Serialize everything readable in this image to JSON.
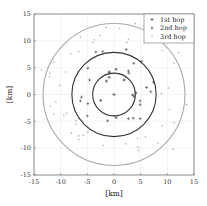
{
  "chart_data": {
    "type": "scatter",
    "title": "",
    "xlabel": "[km]",
    "ylabel": "[km]",
    "xlim": [
      -15,
      15
    ],
    "ylim": [
      -15,
      15
    ],
    "xticks": [
      -15,
      -10,
      -5,
      0,
      5,
      10,
      15
    ],
    "yticks": [
      15,
      10,
      5,
      0,
      -5,
      -10,
      -15
    ],
    "xtick_labels": [
      "-15",
      "-10",
      "-5",
      "0",
      "5",
      "10",
      "15"
    ],
    "ytick_labels": [
      "15",
      "10",
      "5",
      "0",
      "-5",
      "-10",
      "-15"
    ],
    "grid": true,
    "legend_position": "upper right",
    "circles": [
      {
        "name": "1st hop range",
        "radius": 4,
        "color": "#333333"
      },
      {
        "name": "2nd hop range",
        "radius": 7.9,
        "color": "#333333"
      },
      {
        "name": "3rd hop range",
        "radius": 13.3,
        "color": "#aaaaaa"
      }
    ],
    "series": [
      {
        "name": "1st hop",
        "marker": "*",
        "color": "#444444",
        "points": [
          [
            0,
            0
          ],
          [
            0.4,
            4.7
          ],
          [
            -0.9,
            4.2
          ],
          [
            1.9,
            2.7
          ],
          [
            -0.9,
            3.2
          ],
          [
            4.1,
            0.3
          ],
          [
            3.8,
            -0.4
          ],
          [
            0.4,
            -4.3
          ],
          [
            -2.5,
            -1.1
          ],
          [
            3.5,
            -0.1
          ],
          [
            -1.4,
            2.5
          ]
        ]
      },
      {
        "name": "2nd hop",
        "marker": "+",
        "color": "#444444",
        "points": [
          [
            -4.6,
            2.7
          ],
          [
            6.1,
            1.3
          ],
          [
            6.9,
            0.5
          ],
          [
            -6.1,
            -0.5
          ],
          [
            -6.3,
            -1.2
          ],
          [
            -4.9,
            -1.7
          ],
          [
            -5.0,
            -4.0
          ],
          [
            4.9,
            -1.2
          ],
          [
            4.9,
            -1.9
          ],
          [
            4.9,
            -4.5
          ],
          [
            3.6,
            -4.4
          ],
          [
            2.7,
            -4.5
          ],
          [
            -1.2,
            -4.9
          ],
          [
            7.4,
            2.3
          ],
          [
            3.7,
            5.8
          ],
          [
            2.7,
            4.4
          ],
          [
            2.8,
            4.0
          ],
          [
            -2.1,
            8.0
          ],
          [
            -3.4,
            7.9
          ],
          [
            -4.9,
            4.9
          ],
          [
            2.3,
            8.4
          ],
          [
            5.2,
            6.2
          ],
          [
            -0.8,
            4.0
          ]
        ]
      },
      {
        "name": "3rd hop",
        "marker": ".",
        "color": "#b0b0b0",
        "points": [
          [
            -12.0,
            4.0
          ],
          [
            -12.1,
            3.3
          ],
          [
            -10.2,
            1.7
          ],
          [
            -9.4,
            -3.9
          ],
          [
            -10.9,
            -1.4
          ],
          [
            -11.9,
            -2.2
          ],
          [
            -11.3,
            -3.7
          ],
          [
            -8.0,
            -7.2
          ],
          [
            -6.6,
            -7.7
          ],
          [
            -6.6,
            -8.4
          ],
          [
            -5.8,
            -7.6
          ],
          [
            -4.9,
            -7.0
          ],
          [
            -2.0,
            -9.5
          ],
          [
            2.2,
            -9.2
          ],
          [
            4.4,
            -8.2
          ],
          [
            4.5,
            -9.8
          ],
          [
            4.6,
            -10.4
          ],
          [
            5.9,
            -7.9
          ],
          [
            8.2,
            -9.1
          ],
          [
            9.0,
            -5.8
          ],
          [
            10.4,
            -2.8
          ],
          [
            11.3,
            -5.3
          ],
          [
            13.6,
            -1.9
          ],
          [
            10.2,
            1.2
          ],
          [
            8.9,
            0.2
          ],
          [
            11.2,
            5.8
          ],
          [
            9.1,
            8.2
          ],
          [
            12.1,
            7.8
          ],
          [
            8.5,
            12.2
          ],
          [
            7.9,
            12.7
          ],
          [
            4.0,
            13.2
          ],
          [
            1.0,
            12.3
          ],
          [
            -1.5,
            12.5
          ],
          [
            -3.7,
            10.2
          ],
          [
            -6.3,
            10.7
          ],
          [
            -4.0,
            9.7
          ],
          [
            -6.6,
            8.0
          ],
          [
            -8.1,
            7.6
          ],
          [
            -9.1,
            4.2
          ],
          [
            -11.3,
            6.0
          ],
          [
            -13.6,
            4.6
          ],
          [
            -8.9,
            -3.5
          ],
          [
            -7.1,
            -4.9
          ],
          [
            -7.1,
            -5.5
          ],
          [
            2.4,
            9.7
          ],
          [
            2.7,
            10.3
          ],
          [
            7.2,
            10.8
          ],
          [
            5.6,
            12.8
          ],
          [
            -2.6,
            11.0
          ],
          [
            12.8,
            10.9
          ],
          [
            11.1,
            -10.2
          ]
        ]
      }
    ]
  },
  "legend": {
    "items": [
      {
        "label": "1st hop",
        "marker": "*"
      },
      {
        "label": "2nd hop",
        "marker": "+"
      },
      {
        "label": "3rd hop",
        "marker": "."
      }
    ]
  }
}
